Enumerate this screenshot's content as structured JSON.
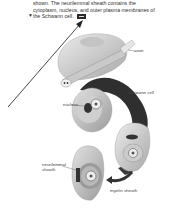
{
  "caption": {
    "lines": [
      "shown. The neurilemmal sheath contains the",
      "cytoplasm, nucleus, and outer plasma membranes of",
      "the Schwann cell."
    ],
    "reference_icon": "media-reference-icon"
  },
  "figure": {
    "labels": {
      "axon": "axon",
      "schwann_cell": "Schwann cell",
      "nucleus": "nucleus",
      "neurilemmal_sheath_line1": "neurilemmal",
      "neurilemmal_sheath_line2": "sheath",
      "myelin_sheath": "myelin sheath"
    },
    "colors": {
      "cell_light": "#d9d9d9",
      "cell_mid": "#b5b5b5",
      "cell_dark": "#555555",
      "arrow": "#333333"
    }
  }
}
